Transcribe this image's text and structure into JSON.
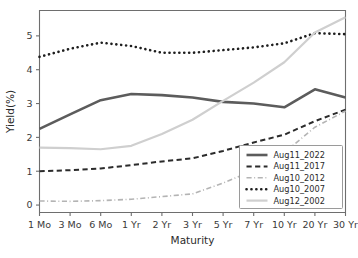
{
  "chart_data": {
    "type": "line",
    "title": "",
    "xlabel": "Maturity",
    "ylabel": "Yield(%)",
    "categories": [
      "1 Mo",
      "3 Mo",
      "6 Mo",
      "1 Yr",
      "2 Yr",
      "3 Yr",
      "5 Yr",
      "7 Yr",
      "10 Yr",
      "20 Yr",
      "30 Yr"
    ],
    "ylim": [
      -0.22,
      5.75
    ],
    "yticks": [
      0,
      1,
      2,
      3,
      4,
      5
    ],
    "ytick_labels": [
      "0",
      "1",
      "2",
      "3",
      "4",
      "5"
    ],
    "grid": false,
    "legend_position": "lower right",
    "series": [
      {
        "name": "Aug11_2022",
        "style": "solid",
        "color": "#5c5c5c",
        "width": 2.6,
        "values": [
          2.25,
          2.68,
          3.1,
          3.28,
          3.25,
          3.18,
          3.05,
          3.0,
          2.89,
          3.42,
          3.18
        ]
      },
      {
        "name": "Aug11_2017",
        "style": "dashed",
        "color": "#2b2b2b",
        "width": 2.0,
        "values": [
          1.0,
          1.03,
          1.08,
          1.18,
          1.29,
          1.38,
          1.6,
          1.85,
          2.08,
          2.48,
          2.82
        ]
      },
      {
        "name": "Aug10_2012",
        "style": "dashdot",
        "color": "#b4b4b4",
        "width": 1.6,
        "values": [
          0.12,
          0.11,
          0.13,
          0.17,
          0.25,
          0.33,
          0.65,
          1.03,
          1.55,
          2.3,
          2.78
        ]
      },
      {
        "name": "Aug10_2007",
        "style": "dotted",
        "color": "#1e1e1e",
        "width": 2.6,
        "values": [
          4.38,
          4.62,
          4.8,
          4.7,
          4.5,
          4.5,
          4.58,
          4.66,
          4.78,
          5.08,
          5.05
        ]
      },
      {
        "name": "Aug12_2002",
        "style": "solid",
        "color": "#cfcfcf",
        "width": 2.2,
        "values": [
          1.7,
          1.68,
          1.65,
          1.75,
          2.1,
          2.52,
          3.08,
          3.62,
          4.22,
          5.1,
          5.55
        ]
      }
    ]
  },
  "legend": {
    "entries": [
      {
        "label": "Aug11_2022"
      },
      {
        "label": "Aug11_2017"
      },
      {
        "label": "Aug10_2012"
      },
      {
        "label": "Aug10_2007"
      },
      {
        "label": "Aug12_2002"
      }
    ]
  },
  "axes": {
    "x_title": "Maturity",
    "y_title": "Yield(%)"
  }
}
